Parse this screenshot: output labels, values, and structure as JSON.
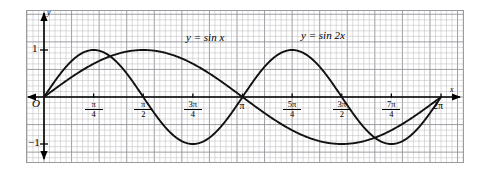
{
  "figure": {
    "background": "#ffffff",
    "grid_color": "#b9b9bd",
    "grid_major_color": "#8e8e95",
    "border_color": "#9a9aa0",
    "curve_color": "#111111",
    "axis_color": "#000000"
  },
  "axes": {
    "origin_label": "O",
    "x_axis_name": "x",
    "y_axis_name": "y",
    "y_ticks": [
      {
        "value": 1,
        "label": "1"
      },
      {
        "value": -1,
        "label": "−1"
      }
    ],
    "x_ticks": [
      {
        "value": 0.7853981634,
        "label_type": "fraction",
        "num": "π",
        "den": "4"
      },
      {
        "value": 1.5707963268,
        "label_type": "fraction",
        "num": "π",
        "den": "2"
      },
      {
        "value": 2.3561944902,
        "label_type": "fraction",
        "num": "3π",
        "den": "4"
      },
      {
        "value": 3.1415926536,
        "label_type": "plain",
        "label": "π"
      },
      {
        "value": 3.926990817,
        "label_type": "fraction",
        "num": "5π",
        "den": "4"
      },
      {
        "value": 4.7123889804,
        "label_type": "fraction",
        "num": "3π",
        "den": "2"
      },
      {
        "value": 5.4977871438,
        "label_type": "fraction",
        "num": "7π",
        "den": "4"
      },
      {
        "value": 6.2831853072,
        "label_type": "plain",
        "label": "2π"
      }
    ]
  },
  "annotations": [
    {
      "name": "curve-label-sin-x",
      "text": "y = sin x",
      "x": 186,
      "y": 32
    },
    {
      "name": "curve-label-sin-2x",
      "text": "y = sin 2x",
      "x": 301,
      "y": 30
    }
  ],
  "chart_data": {
    "type": "line",
    "title": "",
    "xlabel": "x",
    "ylabel": "y",
    "xlim": [
      0,
      6.2831853072
    ],
    "ylim": [
      -1.35,
      1.35
    ],
    "grid": true,
    "legend_position": "inline-on-curve",
    "x_tick_labels": [
      "π/4",
      "π/2",
      "3π/4",
      "π",
      "5π/4",
      "3π/2",
      "7π/4",
      "2π"
    ],
    "y_tick_labels": [
      "1",
      "−1"
    ],
    "series": [
      {
        "name": "y = sin x",
        "expression": "sin(x)",
        "period": 6.2831853072,
        "amplitude": 1,
        "x": [
          0,
          0.3927,
          0.7854,
          1.1781,
          1.5708,
          1.9635,
          2.3562,
          2.7489,
          3.1416,
          3.5343,
          3.927,
          4.3197,
          4.7124,
          5.1051,
          5.4978,
          5.8905,
          6.2832
        ],
        "values": [
          0,
          0.3827,
          0.7071,
          0.9239,
          1,
          0.9239,
          0.7071,
          0.3827,
          0,
          -0.3827,
          -0.7071,
          -0.9239,
          -1,
          -0.9239,
          -0.7071,
          -0.3827,
          0
        ]
      },
      {
        "name": "y = sin 2x",
        "expression": "sin(2x)",
        "period": 3.1415926536,
        "amplitude": 1,
        "x": [
          0,
          0.3927,
          0.7854,
          1.1781,
          1.5708,
          1.9635,
          2.3562,
          2.7489,
          3.1416,
          3.5343,
          3.927,
          4.3197,
          4.7124,
          5.1051,
          5.4978,
          5.8905,
          6.2832
        ],
        "values": [
          0,
          0.7071,
          1,
          0.7071,
          0,
          -0.7071,
          -1,
          -0.7071,
          0,
          0.7071,
          1,
          0.7071,
          0,
          -0.7071,
          -1,
          -0.7071,
          0
        ]
      }
    ]
  }
}
